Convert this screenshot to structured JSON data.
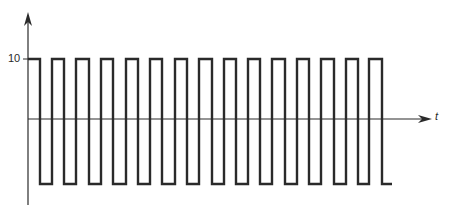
{
  "diagram": {
    "y_axis": {
      "tick_label": "10"
    },
    "x_axis": {
      "label": "t"
    },
    "waveform": {
      "type": "square",
      "high_value": 10,
      "low_value": -10,
      "cycles": 15,
      "transitions_x": [
        28,
        40,
        52,
        64,
        76,
        89,
        101,
        113,
        126,
        138,
        150,
        162,
        175,
        187,
        199,
        212,
        224,
        236,
        248,
        260,
        272,
        285,
        297,
        309,
        321,
        334,
        346,
        358,
        369,
        382,
        392
      ]
    },
    "colors": {
      "line": "#2a2a2a",
      "background": "#ffffff"
    }
  }
}
